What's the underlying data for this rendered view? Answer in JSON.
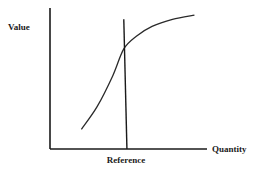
{
  "chart_data": {
    "type": "line",
    "title": "",
    "xlabel": "Quantity",
    "ylabel": "Value",
    "grid": false,
    "legend": "none",
    "xlim": [
      0,
      1
    ],
    "ylim": [
      0,
      1
    ],
    "series": [
      {
        "name": "value-curve",
        "x": [
          0.2,
          0.3,
          0.4,
          0.47,
          0.55,
          0.65,
          0.78,
          0.92
        ],
        "y": [
          0.14,
          0.3,
          0.52,
          0.71,
          0.8,
          0.87,
          0.92,
          0.95
        ]
      }
    ],
    "reference_line": {
      "label": "Reference",
      "x_top": 0.47,
      "x_bottom": 0.49,
      "y_top": 0.92
    }
  }
}
